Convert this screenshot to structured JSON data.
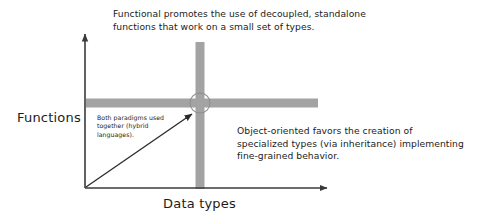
{
  "diagram": {
    "title_text_top": "Functional promotes the use of decoupled, standalone\nfunctions that work on a small set of types.",
    "note_right": "Object-oriented favors the creation of\nspecialized types (via inheritance) implementing\nfine-grained behavior.",
    "note_small": "Both paradigms used\ntogether (hybrid\nlanguages).",
    "axis": {
      "y_label": "Functions",
      "x_label": "Data types"
    },
    "colors": {
      "bar_gray": "#a3a3a3",
      "axis_black": "#3a3a3a",
      "text": "#1c1c1c",
      "background": "#ffffff",
      "circle_outline": "#8f8f8f"
    },
    "geometry": {
      "origin_x": 85,
      "origin_y": 188,
      "y_axis_tip_y": 30,
      "x_axis_tip_x": 331,
      "crosshair_center_x": 200,
      "crosshair_center_y": 103,
      "bar_thickness": 9,
      "circle_radius": 10,
      "vertical_bar_top_y": 42,
      "horizontal_bar_left_x": 86,
      "horizontal_bar_right_x": 318,
      "arrow_start_x": 86,
      "arrow_start_y": 187,
      "arrow_end_x": 194,
      "arrow_end_y": 112
    }
  }
}
